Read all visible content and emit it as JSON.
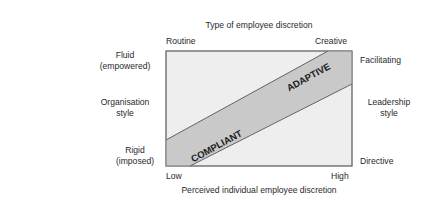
{
  "top_axis": {
    "title": "Type of employee discretion",
    "left_end": "Routine",
    "right_end": "Creative"
  },
  "bottom_axis": {
    "title": "Perceived individual employee discretion",
    "left_end": "Low",
    "right_end": "High"
  },
  "left_axis": {
    "title_line1": "Organisation",
    "title_line2": "style",
    "top_line1": "Fluid",
    "top_line2": "(empowered)",
    "bottom_line1": "Rigid",
    "bottom_line2": "(imposed)"
  },
  "right_axis": {
    "title_line1": "Leadership",
    "title_line2": "style",
    "top": "Facilitating",
    "bottom": "Directive"
  },
  "band": {
    "lower_label": "COMPLIANT",
    "upper_label": "ADAPTIVE"
  },
  "colors": {
    "box_fill": "#eeeeee",
    "band_fill": "#c9c9c9",
    "outline": "#555555",
    "text": "#2a2a2a"
  }
}
